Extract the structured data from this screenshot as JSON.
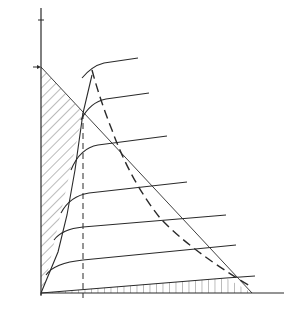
{
  "diagram": {
    "y_axis": {
      "label_main": "I",
      "label_sub": "C",
      "ic_max_main": "I",
      "ic_max_sub": "C max",
      "vcc_rc_label": "V",
      "vcc_rc_sub": "CC",
      "vcc_rc_div": "/R",
      "vcc_rc_div_sub": "C"
    },
    "x_axis": {
      "label_main": "V",
      "label_sub": "CE",
      "vce_sat_main": "V",
      "vce_sat_sub": "CE sat",
      "vcc_main": "V",
      "vcc_sub": "CC",
      "vce_max_main": "V",
      "vce_max_sub": "CE max"
    },
    "annotations": {
      "max_power_curve": "MAXIMUM POWER CURVE",
      "ib_zero_main": "I",
      "ib_zero_sub": "B",
      "ib_zero_value": " = 0",
      "point_a": "A",
      "point_b": "B"
    },
    "regions": [
      {
        "id": "1",
        "label": "1"
      },
      {
        "id": "2",
        "label": "2"
      },
      {
        "id": "3",
        "label": "3"
      }
    ],
    "colors": {
      "line": "#2a2a2a",
      "background": "#ffffff"
    }
  }
}
